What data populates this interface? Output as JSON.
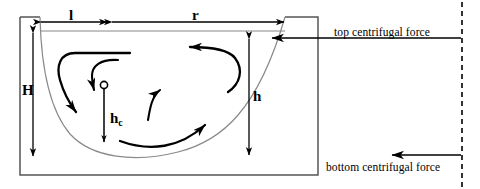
{
  "diagram": {
    "colors": {
      "stroke": "#000000",
      "vessel_line": "#555555",
      "curve_line": "#777777",
      "background": "#ffffff"
    },
    "dimensions": {
      "l": "l",
      "r": "r",
      "H": "H",
      "h": "h",
      "hc_base": "h",
      "hc_sub": "c"
    },
    "annotations": {
      "top_force": "top centrifugal force",
      "bottom_force": "bottom centrifugal force"
    },
    "icons": {
      "vortex_center": "circle-marker-icon",
      "top_force_arrow": "arrow-left-icon",
      "bottom_force_arrow": "arrow-left-icon",
      "axis_dash": "dashed-axis-icon"
    },
    "geometry": {
      "vessel_box": {
        "x": 20,
        "y": 17,
        "w": 298,
        "h": 158
      },
      "dashed_axis_x": 462,
      "vortex_center": {
        "x": 104,
        "y": 86
      },
      "l_span": {
        "x1": 40,
        "x2": 108,
        "y": 22
      },
      "r_span": {
        "x1": 112,
        "x2": 285,
        "y": 22
      },
      "H_span": {
        "x": 33,
        "y1": 32,
        "y2": 157
      },
      "h_span": {
        "x": 249,
        "y1": 38,
        "y2": 156
      },
      "hc_span": {
        "x": 104,
        "y1": 88,
        "y2": 142
      }
    }
  }
}
